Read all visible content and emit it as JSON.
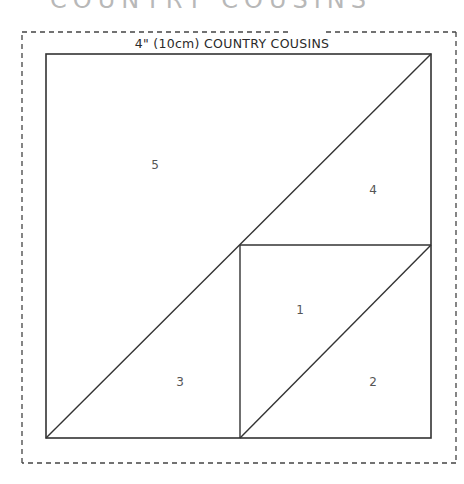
{
  "heading_cutoff": "COUNTRY COUSINS",
  "template": {
    "title": "4\" (10cm) COUNTRY COUSINS",
    "line_color": "#333333",
    "border_color": "#444444"
  },
  "pieces": [
    {
      "number": "1",
      "x": 300,
      "y": 310
    },
    {
      "number": "2",
      "x": 373,
      "y": 382
    },
    {
      "number": "3",
      "x": 180,
      "y": 382
    },
    {
      "number": "4",
      "x": 373,
      "y": 190
    },
    {
      "number": "5",
      "x": 155,
      "y": 165
    }
  ]
}
